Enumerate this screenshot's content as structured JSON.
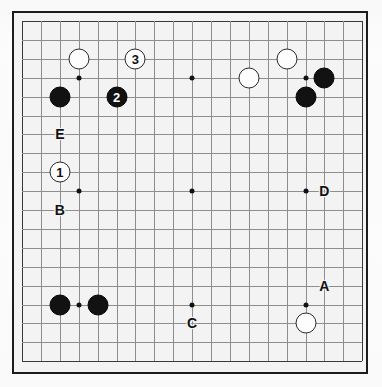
{
  "diagram": {
    "type": "go-board-diagram",
    "board_size": 19,
    "colors": {
      "board_background": "#f3f3f3",
      "grid_line": "#8e8e8e",
      "border": "#1c1c1c",
      "black_stone": "#121212",
      "white_stone": "#fdfdfd",
      "page_background": "#fcfcfc"
    },
    "geometry": {
      "origin_x": 8,
      "origin_y": 8,
      "spacing": 18.9
    },
    "star_points": [
      {
        "col": 3,
        "row": 3
      },
      {
        "col": 9,
        "row": 3
      },
      {
        "col": 15,
        "row": 3
      },
      {
        "col": 3,
        "row": 9
      },
      {
        "col": 9,
        "row": 9
      },
      {
        "col": 15,
        "row": 9
      },
      {
        "col": 3,
        "row": 15
      },
      {
        "col": 9,
        "row": 15
      },
      {
        "col": 15,
        "row": 15
      }
    ],
    "stones": [
      {
        "id": "white-top-left",
        "color": "white",
        "col": 3,
        "row": 2
      },
      {
        "id": "black-upper-left",
        "color": "black",
        "col": 2,
        "row": 4
      },
      {
        "id": "white-upper-right-a",
        "color": "white",
        "col": 12,
        "row": 3
      },
      {
        "id": "white-upper-right-b",
        "color": "white",
        "col": 14,
        "row": 2
      },
      {
        "id": "black-upper-right-a",
        "color": "black",
        "col": 16,
        "row": 3
      },
      {
        "id": "black-upper-right-b",
        "color": "black",
        "col": 15,
        "row": 4
      },
      {
        "id": "black-lower-left-a",
        "color": "black",
        "col": 2,
        "row": 15
      },
      {
        "id": "black-lower-left-b",
        "color": "black",
        "col": 4,
        "row": 15
      },
      {
        "id": "white-lower-right",
        "color": "white",
        "col": 15,
        "row": 16
      }
    ],
    "move_markers": [
      {
        "number": "1",
        "color": "white",
        "col": 2,
        "row": 8
      },
      {
        "number": "2",
        "color": "black",
        "col": 5,
        "row": 4
      },
      {
        "number": "3",
        "color": "white",
        "col": 6,
        "row": 2
      }
    ],
    "point_labels": [
      {
        "text": "A",
        "col": 16,
        "row": 14
      },
      {
        "text": "B",
        "col": 2,
        "row": 10
      },
      {
        "text": "C",
        "col": 9,
        "row": 16
      },
      {
        "text": "D",
        "col": 16,
        "row": 9
      },
      {
        "text": "E",
        "col": 2,
        "row": 6
      }
    ]
  }
}
